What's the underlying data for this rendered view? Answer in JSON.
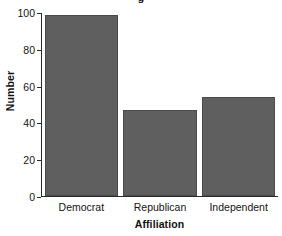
{
  "chart_data": {
    "type": "bar",
    "title": "",
    "title_fragment": "g",
    "categories": [
      "Democrat",
      "Republican",
      "Independent"
    ],
    "values": [
      99,
      47,
      54
    ],
    "xlabel": "Affiliation",
    "ylabel": "Number",
    "ylim": [
      0,
      100
    ],
    "yticks": [
      0,
      20,
      40,
      60,
      80,
      100
    ],
    "ytick_labels": [
      "0",
      "20",
      "40",
      "60",
      "80",
      "100"
    ],
    "grid": false,
    "legend": false,
    "bar_color": "#5f5f5f",
    "bar_edge_color": "#4a4a4a",
    "axis_color": "#2b2b2b",
    "text_color": "#141414"
  }
}
